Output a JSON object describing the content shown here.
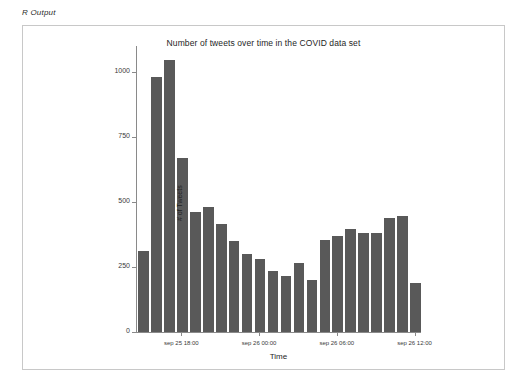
{
  "header": {
    "label": "R Output"
  },
  "panel": {
    "name": "plot-panel"
  },
  "chart_data": {
    "type": "bar",
    "title": "Number of tweets over time in the COVID data set",
    "xlabel": "Time",
    "ylabel": "# of Tweets",
    "bar_color": "#595959",
    "grid": false,
    "legend": null,
    "ylim": [
      0,
      1100
    ],
    "ytick_values": [
      0,
      250,
      500,
      750,
      1000
    ],
    "ytick_labels": [
      "0",
      "250",
      "500",
      "750",
      "1000"
    ],
    "xtick_labels": [
      "sep 25 18:00",
      "sep 26 00:00",
      "sep 26 06:00",
      "sep 26 12:00"
    ],
    "xtick_positions": [
      3.0,
      9.0,
      15.0,
      21.0
    ],
    "categories": [
      "sep 25 15:00",
      "sep 25 16:00",
      "sep 25 17:00",
      "sep 25 18:00",
      "sep 25 19:00",
      "sep 25 20:00",
      "sep 25 21:00",
      "sep 25 22:00",
      "sep 25 23:00",
      "sep 26 00:00",
      "sep 26 01:00",
      "sep 26 02:00",
      "sep 26 03:00",
      "sep 26 04:00",
      "sep 26 05:00",
      "sep 26 06:00",
      "sep 26 07:00",
      "sep 26 08:00",
      "sep 26 09:00",
      "sep 26 10:00",
      "sep 26 11:00",
      "sep 26 12:00"
    ],
    "values": [
      310,
      980,
      1045,
      670,
      460,
      480,
      415,
      350,
      300,
      280,
      235,
      215,
      265,
      200,
      355,
      370,
      395,
      380,
      380,
      440,
      445,
      190
    ]
  }
}
